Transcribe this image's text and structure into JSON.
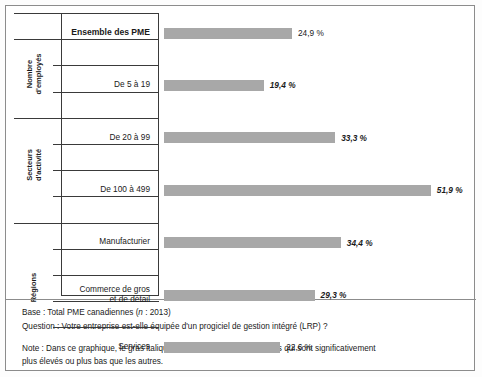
{
  "chart_data": {
    "type": "bar",
    "orientation": "horizontal",
    "title": "",
    "xlabel": "",
    "ylabel": "",
    "xlim": [
      0,
      51.9
    ],
    "grid": false,
    "legend": null,
    "value_suffix": " %",
    "groups": [
      {
        "group_label": "",
        "categories": [
          "Ensemble des PME"
        ],
        "values": [
          24.9
        ],
        "value_labels": [
          "24,9 %"
        ],
        "significant": [
          false
        ],
        "bold_category": [
          true
        ]
      },
      {
        "group_label": "Nombre d'employés",
        "group_label_lines": [
          "Nombre",
          "d'employés"
        ],
        "categories": [
          "De 5 à 19",
          "De 20 à 99",
          "De 100 à 499"
        ],
        "values": [
          19.4,
          33.3,
          51.9
        ],
        "value_labels": [
          "19,4 %",
          "33,3 %",
          "51,9 %"
        ],
        "significant": [
          true,
          true,
          true
        ],
        "bold_category": [
          false,
          false,
          false
        ]
      },
      {
        "group_label": "Secteurs d'activité",
        "group_label_lines": [
          "Secteurs",
          "d'activité"
        ],
        "categories": [
          "Manufacturier",
          "Commerce de gros et de détail",
          "Services",
          "Autres"
        ],
        "category_lines": [
          [
            "Manufacturier"
          ],
          [
            "Commerce de gros",
            "et de détail"
          ],
          [
            "Services"
          ],
          [
            "Autres"
          ]
        ],
        "values": [
          34.4,
          29.3,
          22.6,
          19.5
        ],
        "value_labels": [
          "34,4 %",
          "29,3 %",
          "22,6 %",
          "19,5 %"
        ],
        "significant": [
          true,
          true,
          false,
          false
        ],
        "bold_category": [
          false,
          false,
          false,
          false
        ]
      },
      {
        "group_label": "Régions",
        "group_label_lines": [
          "Régions"
        ],
        "categories": [
          "Québec",
          "Colombie-Britannique",
          "Prairies",
          "Ontario",
          "Atlantique"
        ],
        "values": [
          32.2,
          17.4,
          23.7,
          24.5,
          22.8
        ],
        "value_labels": [
          "32,2 %",
          "17,4 %",
          "23,7 %",
          "24,5 %",
          "22,8 %"
        ],
        "significant": [
          true,
          false,
          false,
          false,
          false
        ],
        "bold_category": [
          false,
          false,
          false,
          false,
          false
        ]
      }
    ],
    "bar_color": "#a8a8a8"
  },
  "footer": {
    "base_prefix": "Base : Total PME canadiennes (",
    "base_italic": "n",
    "base_suffix": " : 2013)",
    "base_full": "Base : Total PME canadiennes (n : 2013)",
    "question": "Question : Votre entreprise est-elle équipée d'un progiciel de gestion intégré (LRP) ?",
    "note_line1": "Note : Dans ce graphique, le gras italique fait ressortir les pourcentages qui sont significativement",
    "note_line2": "plus élevés ou plus bas que les autres."
  }
}
